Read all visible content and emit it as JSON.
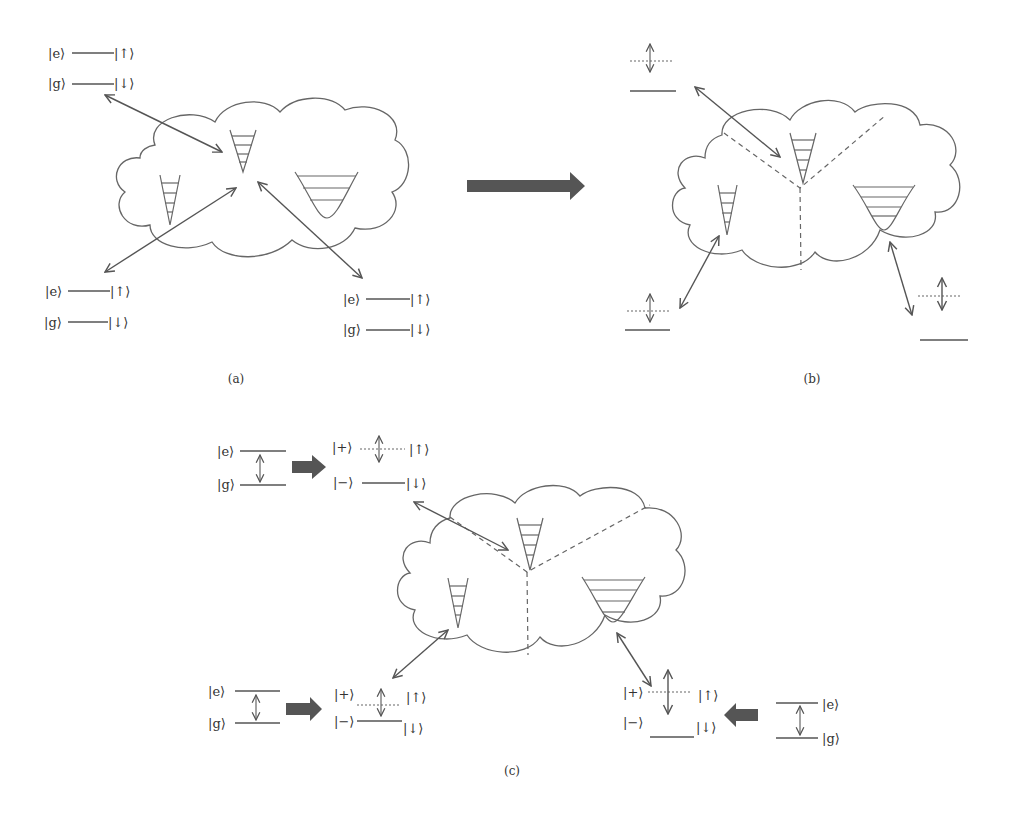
{
  "figure": {
    "panels": [
      {
        "id": "a",
        "caption": "(a)",
        "qubits": [
          {
            "position": "top-left",
            "upper_state": "|e⟩",
            "lower_state": "|g⟩",
            "upper_spin": "|↑⟩",
            "lower_spin": "|↓⟩"
          },
          {
            "position": "bottom-left",
            "upper_state": "|e⟩",
            "lower_state": "|g⟩",
            "upper_spin": "|↑⟩",
            "lower_spin": "|↓⟩"
          },
          {
            "position": "bottom-right",
            "upper_state": "|e⟩",
            "lower_state": "|g⟩",
            "upper_spin": "|↑⟩",
            "lower_spin": "|↓⟩"
          }
        ],
        "bath": "cloud with three potential wells (all coupled)"
      },
      {
        "id": "b",
        "caption": "(b)",
        "bath": "cloud partitioned by dashed lines into three regions, each with a potential well",
        "qubits": [
          "top-left dressed level",
          "bottom-left dressed level",
          "bottom-right dressed level"
        ]
      },
      {
        "id": "c",
        "caption": "(c)",
        "transformations": [
          {
            "position": "top-left",
            "bare_upper": "|e⟩",
            "bare_lower": "|g⟩",
            "dressed_upper": "|+⟩",
            "dressed_lower": "|−⟩",
            "spin_upper": "|↑⟩",
            "spin_lower": "|↓⟩"
          },
          {
            "position": "bottom-left",
            "bare_upper": "|e⟩",
            "bare_lower": "|g⟩",
            "dressed_upper": "|+⟩",
            "dressed_lower": "|−⟩",
            "spin_upper": "|↑⟩",
            "spin_lower": "|↓⟩"
          },
          {
            "position": "bottom-right",
            "bare_upper": "|e⟩",
            "bare_lower": "|g⟩",
            "dressed_upper": "|+⟩",
            "dressed_lower": "|−⟩",
            "spin_upper": "|↑⟩",
            "spin_lower": "|↓⟩"
          }
        ]
      }
    ],
    "labels": {
      "e": "|e⟩",
      "g": "|g⟩",
      "up": "|↑⟩",
      "down": "|↓⟩",
      "plus": "|+⟩",
      "minus": "|−⟩",
      "cap_a": "(a)",
      "cap_b": "(b)",
      "cap_c": "(c)"
    },
    "colors": {
      "line": "#555555",
      "arrow_fill": "#555555",
      "background": "#ffffff"
    }
  }
}
